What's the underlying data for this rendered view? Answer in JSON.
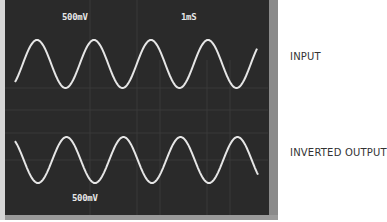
{
  "scope": {
    "top_volts_div": "500mV",
    "time_div": "1mS",
    "bottom_volts_div": "500mV"
  },
  "labels": {
    "input": "INPUT",
    "inverted_output": "INVERTED OUTPUT"
  },
  "colors": {
    "screen": "#2a2a2a",
    "trace": "#e6e6e6",
    "grid": "#5a5a5a",
    "label_text": "#333333"
  },
  "traces": {
    "input": {
      "description": "sine wave",
      "cycles_visible": 4.3,
      "period_px": 57
    },
    "inverted_output": {
      "description": "inverted sine wave (180° phase)",
      "cycles_visible": 4.3,
      "period_px": 57
    }
  }
}
